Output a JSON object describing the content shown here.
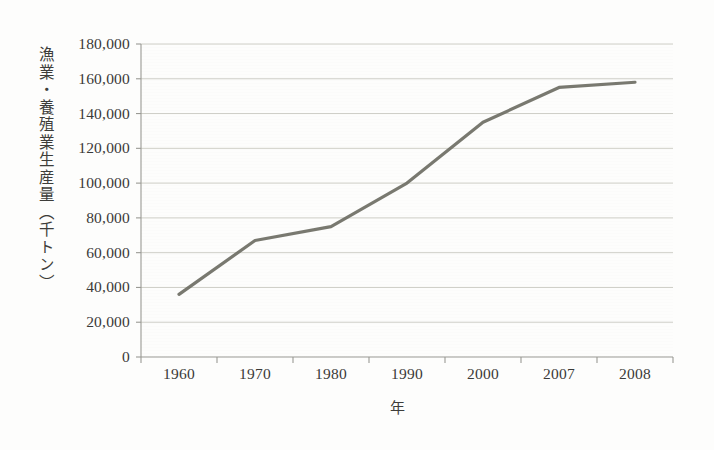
{
  "chart_data": {
    "type": "line",
    "title": "",
    "xlabel": "年",
    "ylabel": "漁業・養殖業生産量（千トン）",
    "categories": [
      "1960",
      "1970",
      "1980",
      "1990",
      "2000",
      "2007",
      "2008"
    ],
    "series": [
      {
        "name": "漁業・養殖業生産量",
        "values": [
          36000,
          67000,
          75000,
          100000,
          135000,
          155000,
          158000
        ],
        "color": "#6e6e64"
      }
    ],
    "ylim": [
      0,
      180000
    ],
    "ytick_values": [
      0,
      20000,
      40000,
      60000,
      80000,
      100000,
      120000,
      140000,
      160000,
      180000
    ],
    "ytick_labels": [
      "0",
      "20,000",
      "40,000",
      "60,000",
      "80,000",
      "100,000",
      "120,000",
      "140,000",
      "160,000",
      "180,000"
    ],
    "grid": "horizontal",
    "legend": "none",
    "axis_color": "#9a9a94",
    "gridline_color": "#c9c9c2",
    "background_color": "#fdfdfc"
  }
}
